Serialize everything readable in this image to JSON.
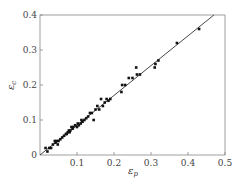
{
  "chart_data": {
    "type": "scatter",
    "title": "",
    "xlabel": "ε_p",
    "ylabel": "ε_c",
    "xlim": [
      0,
      0.5
    ],
    "ylim": [
      0,
      0.4
    ],
    "x_ticks": [
      "0.1",
      "0.2",
      "0.3",
      "0.4",
      "0.5"
    ],
    "y_ticks": [
      "0",
      "0.1",
      "0.2",
      "0.3",
      "0.4"
    ],
    "grid": false,
    "legend": "none",
    "series": [
      {
        "name": "data",
        "marker": "square",
        "points": [
          [
            0.015,
            0.02
          ],
          [
            0.02,
            0.01
          ],
          [
            0.025,
            0.02
          ],
          [
            0.03,
            0.02
          ],
          [
            0.035,
            0.03
          ],
          [
            0.04,
            0.04
          ],
          [
            0.042,
            0.035
          ],
          [
            0.045,
            0.04
          ],
          [
            0.048,
            0.03
          ],
          [
            0.05,
            0.04
          ],
          [
            0.055,
            0.045
          ],
          [
            0.06,
            0.05
          ],
          [
            0.065,
            0.055
          ],
          [
            0.07,
            0.06
          ],
          [
            0.072,
            0.06
          ],
          [
            0.075,
            0.065
          ],
          [
            0.078,
            0.07
          ],
          [
            0.08,
            0.065
          ],
          [
            0.082,
            0.07
          ],
          [
            0.085,
            0.08
          ],
          [
            0.088,
            0.075
          ],
          [
            0.09,
            0.08
          ],
          [
            0.095,
            0.085
          ],
          [
            0.1,
            0.08
          ],
          [
            0.102,
            0.09
          ],
          [
            0.105,
            0.085
          ],
          [
            0.11,
            0.09
          ],
          [
            0.112,
            0.1
          ],
          [
            0.115,
            0.095
          ],
          [
            0.12,
            0.1
          ],
          [
            0.125,
            0.105
          ],
          [
            0.13,
            0.11
          ],
          [
            0.135,
            0.12
          ],
          [
            0.14,
            0.12
          ],
          [
            0.145,
            0.1
          ],
          [
            0.15,
            0.13
          ],
          [
            0.155,
            0.14
          ],
          [
            0.16,
            0.13
          ],
          [
            0.165,
            0.16
          ],
          [
            0.17,
            0.14
          ],
          [
            0.175,
            0.15
          ],
          [
            0.18,
            0.16
          ],
          [
            0.185,
            0.155
          ],
          [
            0.19,
            0.16
          ],
          [
            0.22,
            0.18
          ],
          [
            0.222,
            0.2
          ],
          [
            0.23,
            0.2
          ],
          [
            0.24,
            0.22
          ],
          [
            0.25,
            0.22
          ],
          [
            0.26,
            0.25
          ],
          [
            0.262,
            0.23
          ],
          [
            0.27,
            0.23
          ],
          [
            0.31,
            0.25
          ],
          [
            0.312,
            0.26
          ],
          [
            0.32,
            0.27
          ],
          [
            0.37,
            0.32
          ],
          [
            0.43,
            0.36
          ]
        ]
      }
    ],
    "fit_line": {
      "x": [
        0,
        0.47
      ],
      "y": [
        0,
        0.4
      ]
    }
  },
  "labels": {
    "x_axis": "ε",
    "x_sub": "p",
    "y_axis": "ε",
    "y_sub": "c",
    "origin": "0"
  }
}
